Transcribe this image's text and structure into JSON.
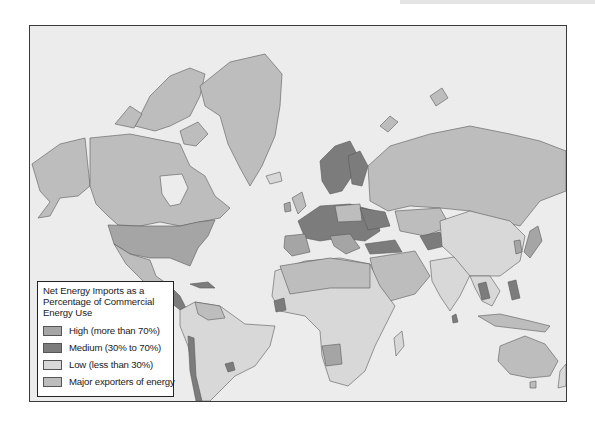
{
  "map": {
    "title": "Net Energy Imports as a Percentage of Commercial Energy Use",
    "title_lines": [
      "Net Energy Imports as a",
      "Percentage of Commercial",
      "Energy Use"
    ],
    "legend": [
      {
        "label": "High (more than 70%)",
        "color": "#a5a5a5"
      },
      {
        "label": "Medium (30% to 70%)",
        "color": "#7c7c7c"
      },
      {
        "label": "Low (less than 30%)",
        "color": "#d8d8d8"
      },
      {
        "label": "Major exporters of energy",
        "color": "#bdbdbd"
      }
    ],
    "colors": {
      "ocean": "#ececec",
      "border": "#555555",
      "frame": "#3a3a3a"
    }
  }
}
